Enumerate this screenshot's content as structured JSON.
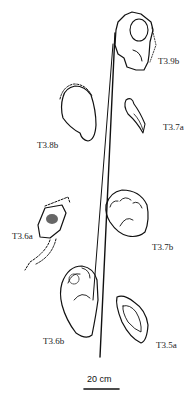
{
  "figure": {
    "labels": {
      "t39b": "T3.9b",
      "t37a": "T3.7a",
      "t38b": "T3.8b",
      "t37b": "T3.7b",
      "t36a": "T3.6a",
      "t36b": "T3.6b",
      "t35a": "T3.5a"
    },
    "scale_bar": {
      "label": "20 cm"
    }
  }
}
